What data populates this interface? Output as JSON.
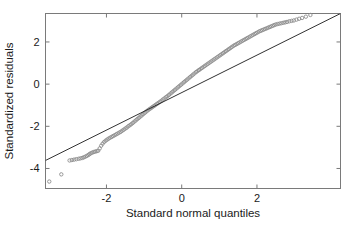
{
  "figure": {
    "background_color": "#ffffff",
    "width": 358,
    "height": 229
  },
  "chart_data": {
    "type": "scatter",
    "title": "",
    "subtitle": "",
    "xlabel": "Standard normal quantiles",
    "ylabel": "Standardized residuals",
    "xlim": [
      -3.62,
      4.22
    ],
    "ylim": [
      -4.95,
      3.35
    ],
    "xticks": [
      -2,
      0,
      2
    ],
    "xtick_labels": [
      "-2",
      "0",
      "2"
    ],
    "yticks": [
      -4,
      -2,
      0,
      2
    ],
    "ytick_labels": [
      "-4",
      "-2",
      "0",
      "2"
    ],
    "grid": false,
    "legend": "none",
    "point_color": "#8c8c8c",
    "point_size": 1.7,
    "line_color": "#1a1a1a",
    "frame_color": "#7a7a7a",
    "annotations": [
      "Lower tail deviates below the 45-degree reference line",
      "Two isolated low outliers near x = -3.5"
    ],
    "reference_line": {
      "name": "identity-line",
      "x": [
        -3.62,
        4.22
      ],
      "y": [
        -3.62,
        3.35
      ],
      "slope": 1.0,
      "intercept": 0.0
    },
    "series": [
      {
        "name": "Standardized residuals vs normal quantiles",
        "marker": "circle",
        "x": [
          -3.52,
          -3.2,
          -2.98,
          -2.92,
          -2.86,
          -2.8,
          -2.74,
          -2.69,
          -2.64,
          -2.6,
          -2.56,
          -2.52,
          -2.48,
          -2.45,
          -2.42,
          -2.38,
          -2.34,
          -2.3,
          -2.26,
          -2.22,
          -2.18,
          -2.14,
          -2.1,
          -2.06,
          -2.02,
          -1.98,
          -1.94,
          -1.9,
          -1.86,
          -1.82,
          -1.78,
          -1.74,
          -1.7,
          -1.66,
          -1.62,
          -1.58,
          -1.54,
          -1.5,
          -1.46,
          -1.42,
          -1.38,
          -1.34,
          -1.3,
          -1.26,
          -1.22,
          -1.18,
          -1.14,
          -1.1,
          -1.06,
          -1.02,
          -0.98,
          -0.94,
          -0.9,
          -0.86,
          -0.82,
          -0.78,
          -0.74,
          -0.7,
          -0.66,
          -0.62,
          -0.58,
          -0.54,
          -0.5,
          -0.46,
          -0.42,
          -0.38,
          -0.34,
          -0.3,
          -0.26,
          -0.22,
          -0.18,
          -0.14,
          -0.1,
          -0.06,
          -0.02,
          0.02,
          0.06,
          0.1,
          0.14,
          0.18,
          0.22,
          0.26,
          0.3,
          0.34,
          0.38,
          0.42,
          0.46,
          0.5,
          0.54,
          0.58,
          0.62,
          0.66,
          0.7,
          0.74,
          0.78,
          0.82,
          0.86,
          0.9,
          0.94,
          0.98,
          1.02,
          1.06,
          1.1,
          1.14,
          1.18,
          1.22,
          1.26,
          1.3,
          1.34,
          1.38,
          1.42,
          1.46,
          1.5,
          1.54,
          1.58,
          1.62,
          1.66,
          1.7,
          1.74,
          1.78,
          1.82,
          1.86,
          1.9,
          1.94,
          1.98,
          2.02,
          2.06,
          2.1,
          2.14,
          2.18,
          2.22,
          2.26,
          2.3,
          2.34,
          2.38,
          2.42,
          2.46,
          2.5,
          2.55,
          2.6,
          2.65,
          2.7,
          2.75,
          2.8,
          2.86,
          2.92,
          2.98,
          3.05,
          3.12,
          3.2,
          3.3,
          3.42
        ],
        "y": [
          -4.62,
          -4.28,
          -3.62,
          -3.6,
          -3.58,
          -3.56,
          -3.54,
          -3.52,
          -3.5,
          -3.47,
          -3.44,
          -3.4,
          -3.36,
          -3.32,
          -3.28,
          -3.25,
          -3.22,
          -3.2,
          -3.18,
          -3.16,
          -3.05,
          -2.92,
          -2.82,
          -2.74,
          -2.68,
          -2.63,
          -2.58,
          -2.54,
          -2.5,
          -2.46,
          -2.42,
          -2.38,
          -2.34,
          -2.3,
          -2.26,
          -2.21,
          -2.16,
          -2.11,
          -2.06,
          -2.0,
          -1.95,
          -1.9,
          -1.84,
          -1.78,
          -1.72,
          -1.66,
          -1.6,
          -1.54,
          -1.48,
          -1.42,
          -1.36,
          -1.3,
          -1.24,
          -1.19,
          -1.14,
          -1.09,
          -1.04,
          -0.99,
          -0.94,
          -0.89,
          -0.84,
          -0.79,
          -0.73,
          -0.68,
          -0.62,
          -0.57,
          -0.51,
          -0.45,
          -0.39,
          -0.33,
          -0.27,
          -0.21,
          -0.15,
          -0.09,
          -0.03,
          0.03,
          0.09,
          0.15,
          0.21,
          0.27,
          0.33,
          0.39,
          0.45,
          0.51,
          0.57,
          0.62,
          0.67,
          0.72,
          0.77,
          0.82,
          0.87,
          0.92,
          0.97,
          1.02,
          1.07,
          1.12,
          1.17,
          1.22,
          1.27,
          1.32,
          1.37,
          1.42,
          1.47,
          1.52,
          1.57,
          1.62,
          1.67,
          1.72,
          1.77,
          1.82,
          1.86,
          1.9,
          1.94,
          1.98,
          2.02,
          2.06,
          2.1,
          2.14,
          2.18,
          2.22,
          2.26,
          2.3,
          2.34,
          2.38,
          2.42,
          2.46,
          2.5,
          2.53,
          2.56,
          2.59,
          2.62,
          2.65,
          2.68,
          2.71,
          2.74,
          2.77,
          2.8,
          2.83,
          2.85,
          2.87,
          2.89,
          2.91,
          2.93,
          2.95,
          2.98,
          3.0,
          3.02,
          3.06,
          3.1,
          3.14,
          3.2,
          3.28
        ]
      }
    ]
  }
}
